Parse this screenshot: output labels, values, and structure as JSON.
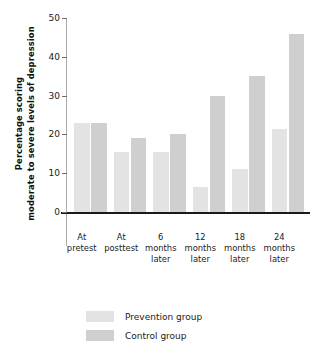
{
  "chart_data": {
    "type": "bar",
    "title": "",
    "xlabel": "",
    "ylabel": "Percentage scoring moderate to severe levels of depression",
    "ylabel_line1": "Percentage scoring",
    "ylabel_line2": "moderate to severe levels of depression",
    "categories": [
      "At pretest",
      "At posttest",
      "6 months later",
      "12 months later",
      "18 months later",
      "24 months later"
    ],
    "category_lines": [
      [
        "At",
        "pretest"
      ],
      [
        "At",
        "posttest"
      ],
      [
        "6",
        "months",
        "later"
      ],
      [
        "12",
        "months",
        "later"
      ],
      [
        "18",
        "months",
        "later"
      ],
      [
        "24",
        "months",
        "later"
      ]
    ],
    "series": [
      {
        "name": "Prevention group",
        "color": "#e3e3e3",
        "values": [
          23,
          15.5,
          15.5,
          6.5,
          11,
          21.5
        ]
      },
      {
        "name": "Control group",
        "color": "#cfcfcf",
        "values": [
          23,
          19,
          20,
          30,
          35,
          46
        ]
      }
    ],
    "ylim": [
      0,
      50
    ],
    "yticks": [
      0,
      10,
      20,
      30,
      40,
      50
    ],
    "ytick_labels": [
      "0",
      "10",
      "20",
      "30",
      "40",
      "50"
    ],
    "grid": false,
    "legend_position": "bottom-left"
  },
  "legend": {
    "items": [
      {
        "label": "Prevention group",
        "color": "#e3e3e3"
      },
      {
        "label": "Control group",
        "color": "#cfcfcf"
      }
    ]
  }
}
